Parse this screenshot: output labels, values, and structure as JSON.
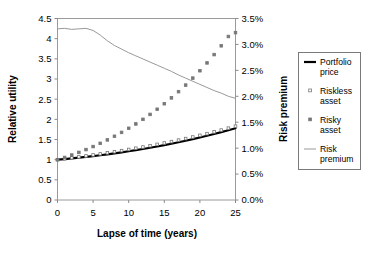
{
  "chart_data": {
    "type": "line",
    "title": "",
    "xlabel": "Lapse of time (years)",
    "ylabel": "Relative utility",
    "y2label": "Risk premium",
    "xlim": [
      0,
      25
    ],
    "ylim": [
      0,
      4.5
    ],
    "y2lim": [
      0,
      0.035
    ],
    "grid": false,
    "legend_position": "right-outside",
    "xticks": [
      "0",
      "5",
      "10",
      "15",
      "20",
      "25"
    ],
    "xtick_values": [
      0,
      5,
      10,
      15,
      20,
      25
    ],
    "yticks": [
      "0",
      "0.5",
      "1",
      "1.5",
      "2",
      "2.5",
      "3",
      "3.5",
      "4",
      "4.5"
    ],
    "ytick_values": [
      0,
      0.5,
      1,
      1.5,
      2,
      2.5,
      3,
      3.5,
      4,
      4.5
    ],
    "y2ticks": [
      "0.0%",
      "0.5%",
      "1.0%",
      "1.5%",
      "2.0%",
      "2.5%",
      "3.0%",
      "3.5%"
    ],
    "y2tick_values": [
      0,
      0.005,
      0.01,
      0.015,
      0.02,
      0.025,
      0.03,
      0.035
    ],
    "x": [
      0,
      1,
      2,
      3,
      4,
      5,
      6,
      7,
      8,
      9,
      10,
      11,
      12,
      13,
      14,
      15,
      16,
      17,
      18,
      19,
      20,
      21,
      22,
      23,
      24,
      25
    ],
    "series": [
      {
        "name": "Portfolio price",
        "axis": "left",
        "style": "line",
        "color": "#000000",
        "width": 2.2,
        "values": [
          1.0,
          1.015,
          1.032,
          1.05,
          1.069,
          1.089,
          1.11,
          1.133,
          1.157,
          1.182,
          1.208,
          1.236,
          1.265,
          1.295,
          1.327,
          1.36,
          1.395,
          1.431,
          1.469,
          1.508,
          1.549,
          1.592,
          1.636,
          1.682,
          1.73,
          1.78
        ]
      },
      {
        "name": "Riskless asset",
        "axis": "left",
        "style": "dots",
        "color": "#777777",
        "marker": "open-square",
        "values": [
          1.0,
          1.022,
          1.045,
          1.068,
          1.092,
          1.117,
          1.143,
          1.169,
          1.196,
          1.224,
          1.253,
          1.283,
          1.314,
          1.346,
          1.379,
          1.413,
          1.448,
          1.485,
          1.523,
          1.562,
          1.603,
          1.645,
          1.689,
          1.734,
          1.781,
          1.83
        ]
      },
      {
        "name": "Risky asset",
        "axis": "left",
        "style": "dots",
        "color": "#777777",
        "marker": "filled-square",
        "values": [
          1.0,
          1.055,
          1.115,
          1.18,
          1.25,
          1.325,
          1.405,
          1.49,
          1.58,
          1.676,
          1.778,
          1.886,
          2.0,
          2.122,
          2.25,
          2.387,
          2.532,
          2.686,
          2.849,
          3.022,
          3.205,
          3.399,
          3.605,
          3.823,
          4.054,
          4.15
        ]
      },
      {
        "name": "Risk premium",
        "axis": "right",
        "style": "line",
        "color": "#999999",
        "width": 1,
        "values": [
          0.033,
          0.0331,
          0.0329,
          0.033,
          0.0331,
          0.0327,
          0.0318,
          0.0307,
          0.0298,
          0.0291,
          0.0284,
          0.0278,
          0.0272,
          0.0266,
          0.026,
          0.0254,
          0.0248,
          0.0241,
          0.0235,
          0.0229,
          0.0223,
          0.0217,
          0.0211,
          0.0206,
          0.02,
          0.0196
        ]
      }
    ],
    "legend": [
      {
        "label_line1": "Portfolio",
        "label_line2": "price",
        "marker": "line",
        "color": "#000000"
      },
      {
        "label_line1": "Riskless",
        "label_line2": "asset",
        "marker": "open-square",
        "color": "#777777"
      },
      {
        "label_line1": "Risky",
        "label_line2": "asset",
        "marker": "filled-square",
        "color": "#777777"
      },
      {
        "label_line1": "Risk",
        "label_line2": "premium",
        "marker": "thin-line",
        "color": "#999999"
      }
    ]
  }
}
